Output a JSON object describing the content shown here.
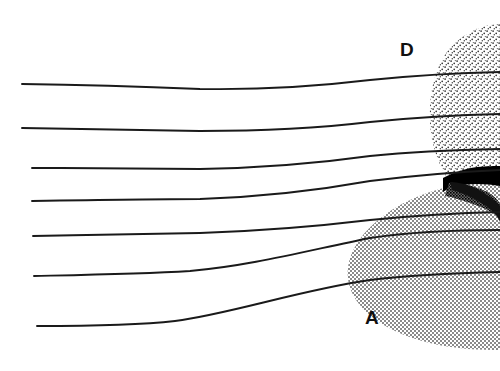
{
  "figure": {
    "title": "",
    "background_color": "#ffffff",
    "width": 500,
    "height": 371,
    "line_color": "#1a1a1a",
    "dark_shape_color": "#000000"
  },
  "labels": {
    "upper_region": "D",
    "lower_region": "A"
  },
  "label_positions": {
    "upper_region": {
      "x": 400,
      "y": 56
    },
    "lower_region": {
      "x": 365,
      "y": 324
    }
  },
  "regions": [
    {
      "name": "upper-stippled-region",
      "label": "D",
      "fill_style": "sparse-dot-stipple",
      "fill_color": "#3a3a3a",
      "density": "sparse"
    },
    {
      "name": "lower-hatched-region",
      "label": "A",
      "fill_style": "dense-checker-hatch",
      "fill_color": "#8e8e8e",
      "density": "dense"
    },
    {
      "name": "dark-wedge-shape",
      "label": "",
      "fill_style": "solid",
      "fill_color": "#000000",
      "density": "solid"
    }
  ],
  "chart_data": {
    "type": "line",
    "title": "",
    "xlabel": "",
    "ylabel": "",
    "grid": false,
    "legend": "none",
    "xlim": [
      0,
      500
    ],
    "ylim": [
      0,
      371
    ],
    "annotations": [
      {
        "text": "D",
        "x": 400,
        "y": 56
      },
      {
        "text": "A",
        "x": 365,
        "y": 324
      }
    ],
    "series": [
      {
        "name": "streamline-1",
        "path": "M 22,84 C 90,85 150,87 200,89 C 260,90 320,86 370,80 C 410,76 450,73 500,72"
      },
      {
        "name": "streamline-2",
        "path": "M 22,128 C 90,129 150,130 200,131 C 260,131 320,128 370,122 C 410,118 455,115 500,114"
      },
      {
        "name": "streamline-3",
        "path": "M 32,168 C 90,168 150,169 200,169 C 260,168 320,163 370,156 C 410,152 455,150 500,149"
      },
      {
        "name": "streamline-4",
        "path": "M 32,201 C 90,200 150,199 200,199 C 260,197 320,190 370,181 C 410,176 455,172 500,170"
      },
      {
        "name": "streamline-5",
        "path": "M 33,236 C 90,235 150,234 200,233 C 260,231 320,226 370,220 C 410,216 455,213 500,212"
      },
      {
        "name": "streamline-6",
        "path": "M 34,276 C 80,275 140,274 190,271 C 250,266 310,250 370,238 C 410,232 455,230 500,230"
      },
      {
        "name": "streamline-7",
        "path": "M 37,326 C 90,326 140,325 175,321 C 230,314 300,290 370,280 C 410,275 455,273 500,272"
      }
    ]
  }
}
